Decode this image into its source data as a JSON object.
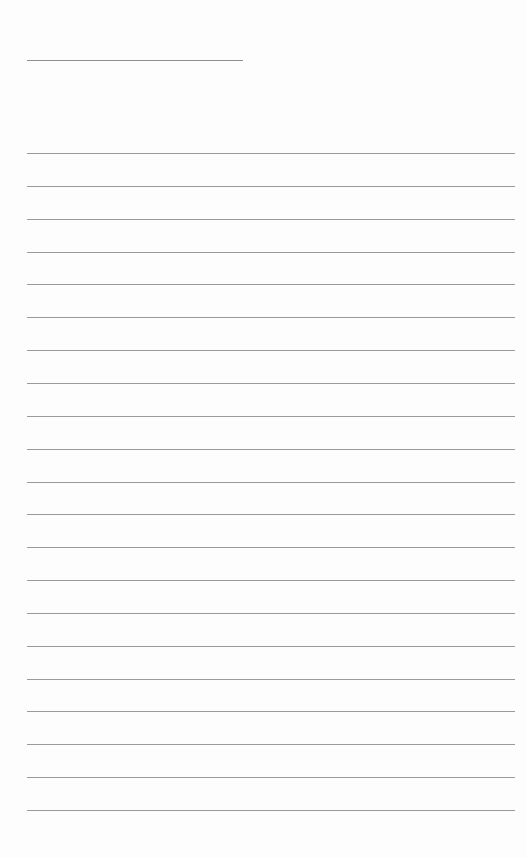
{
  "page": {
    "type": "lined-paper",
    "background_color": "#fdfdfd",
    "line_color": "#9a9a9a",
    "title_line": {
      "top": 60,
      "left": 27,
      "width": 216
    },
    "rules": {
      "count": 21,
      "first_top": 153,
      "spacing": 32.85,
      "left": 27,
      "width": 488
    }
  }
}
